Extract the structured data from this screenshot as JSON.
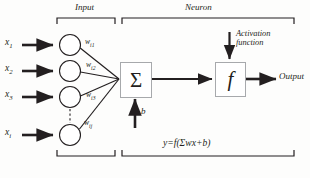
{
  "diagram": {
    "sections": {
      "input_label": "Input",
      "neuron_label": "Neuron"
    },
    "inputs": [
      {
        "label": "x",
        "sub": "1"
      },
      {
        "label": "x",
        "sub": "2"
      },
      {
        "label": "x",
        "sub": "3"
      },
      {
        "label": "x",
        "sub": "i"
      }
    ],
    "weights": [
      {
        "label": "w",
        "sub": "i1"
      },
      {
        "label": "w",
        "sub": "i2"
      },
      {
        "label": "w",
        "sub": "i3"
      },
      {
        "label": "w",
        "sub": "ij"
      }
    ],
    "summation_symbol": "Σ",
    "activation_symbol": "f",
    "bias_label": "b",
    "activation_label_line1": "Activation",
    "activation_label_line2": "function",
    "output_label": "Output",
    "formula": "y=f(Σwx+b)",
    "colors": {
      "stroke": "#231f20",
      "box_border": "#a7a9ac",
      "bracket": "#231f20",
      "background": "#fdfdfc"
    }
  }
}
